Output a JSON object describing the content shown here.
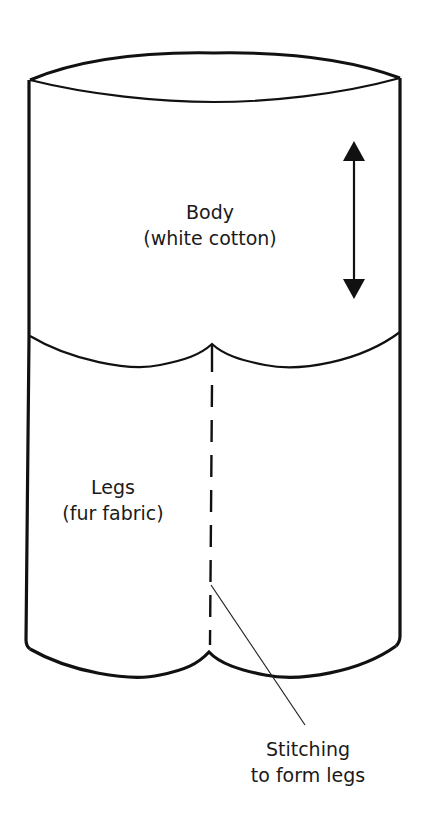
{
  "diagram": {
    "type": "pattern-illustration",
    "colors": {
      "stroke": "#111111",
      "background": "#ffffff",
      "text": "#1a1a1a"
    },
    "labels": {
      "body": {
        "line1": "Body",
        "line2": "(white cotton)"
      },
      "legs": {
        "line1": "Legs",
        "line2": "(fur fabric)"
      },
      "stitching": {
        "line1": "Stitching",
        "line2": "to form legs"
      }
    },
    "annotations": {
      "arrow": "double-headed vertical arrow (grain/stretch direction)",
      "seam": "dashed stitching line down center of legs"
    }
  }
}
